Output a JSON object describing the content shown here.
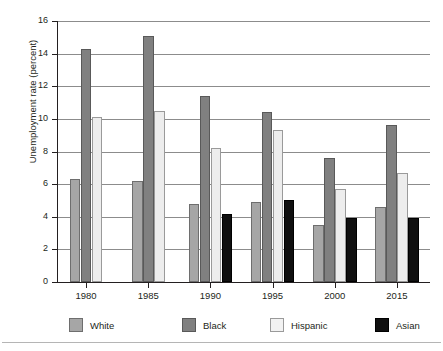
{
  "chart_data": {
    "type": "bar",
    "title": "",
    "subtitle": "",
    "xlabel": "",
    "ylabel": "Unemployment rate (percent)",
    "ylim": [
      0,
      16
    ],
    "ytick_step": 2,
    "yticks": [
      "0",
      "2",
      "4",
      "6",
      "8",
      "10",
      "12",
      "14",
      "16"
    ],
    "grid": true,
    "legend_position": "bottom",
    "categories": [
      "1980",
      "1985",
      "1990",
      "1995",
      "2000",
      "2015"
    ],
    "series": [
      {
        "name": "White",
        "color": "#a6a6a6",
        "values": [
          6.3,
          6.2,
          4.8,
          4.9,
          3.5,
          4.6
        ]
      },
      {
        "name": "Black",
        "color": "#808080",
        "values": [
          14.3,
          15.1,
          11.4,
          10.4,
          7.6,
          9.6
        ]
      },
      {
        "name": "Hispanic",
        "color": "#ededed",
        "values": [
          10.1,
          10.5,
          8.2,
          9.3,
          5.7,
          6.7
        ]
      },
      {
        "name": "Asian",
        "color": "#101010",
        "values": [
          null,
          null,
          4.2,
          5.0,
          3.9,
          3.9
        ]
      }
    ]
  },
  "legend": {
    "items": [
      {
        "label": "White"
      },
      {
        "label": "Black"
      },
      {
        "label": "Hispanic"
      },
      {
        "label": "Asian"
      }
    ]
  },
  "axes": {
    "y_title": "Unemployment rate (percent)"
  }
}
